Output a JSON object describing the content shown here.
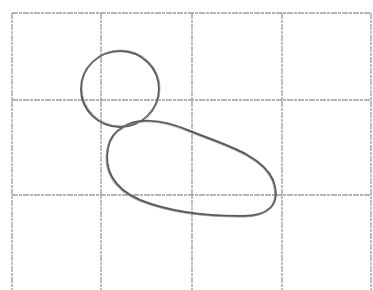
{
  "drawing": {
    "description": "Pencil sketch on a 4x3 grid: small circle (head) above a larger rounded blob (body)",
    "colors": {
      "background": "#ffffff",
      "grid": "#8a8a8a",
      "stroke": "#5a5a5a"
    },
    "grid": {
      "vertical_x": [
        12,
        101,
        192,
        282,
        371
      ],
      "horizontal_y": [
        13,
        100,
        195
      ],
      "top": 13,
      "bottom": 290,
      "left": 12,
      "right": 371
    },
    "shapes": {
      "head_circle": {
        "cx": 120,
        "cy": 89,
        "rx": 39,
        "ry": 38
      },
      "body_blob": "M 122 128 C 135 118, 160 118, 190 131 C 225 145, 262 155, 273 180 C 282 205, 268 217, 240 216 C 205 216, 170 212, 140 200 C 112 188, 104 168, 108 148 C 110 138, 114 132, 122 128 Z"
    }
  }
}
